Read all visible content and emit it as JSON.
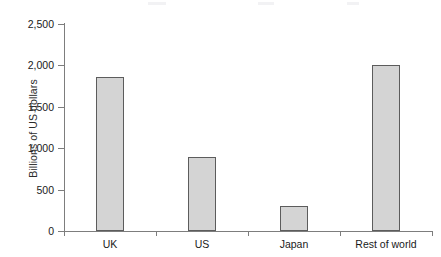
{
  "chart_data": {
    "type": "bar",
    "title": "",
    "subtitle": "",
    "xlabel": "",
    "ylabel": "Billions of US dollars",
    "categories": [
      "UK",
      "US",
      "Japan",
      "Rest of world"
    ],
    "values": [
      1850,
      890,
      300,
      2000
    ],
    "series": [
      {
        "name": "",
        "values": [
          1850,
          890,
          300,
          2000
        ]
      }
    ],
    "ylim": [
      0,
      2500
    ],
    "y_ticks": [
      0,
      500,
      1000,
      1500,
      2000,
      2500
    ],
    "y_tick_labels": [
      "0",
      "500",
      "1,000",
      "1,500",
      "2,000",
      "2,500"
    ],
    "grid": false,
    "legend": false,
    "legend_position": "none",
    "orientation": "vertical",
    "bar_color": "#d4d4d4",
    "bar_border_color": "#5c5c5c",
    "axis_color": "#7d7d7d",
    "background_color": "#ffffff",
    "text_color": "#1a1a1a"
  }
}
